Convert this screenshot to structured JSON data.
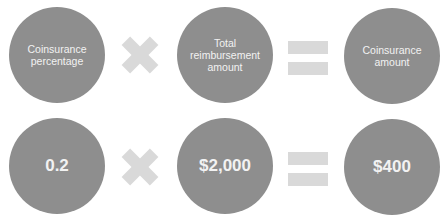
{
  "rows": [
    {
      "operand1": "Coinsurance\npercentage",
      "operand2": "Total\nreimbursement\namount",
      "result": "Coinsurance\namount"
    },
    {
      "operand1": "0.2",
      "operand2": "$2,000",
      "result": "$400"
    }
  ],
  "operators": {
    "multiply": "multiply-sign",
    "equals": "equals-sign"
  },
  "colors": {
    "circle": "#8e8e8e",
    "operator": "#d9d9d9",
    "text": "#f2f2f2"
  }
}
